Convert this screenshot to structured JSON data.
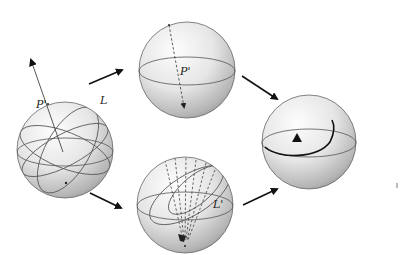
{
  "diagram": {
    "type": "flow",
    "colors": {
      "sphere_light": "#fbfbfb",
      "sphere_dark": "#9a9a9a",
      "line": "#555555",
      "arrow": "#111111",
      "background": "#ffffff"
    },
    "nodes": [
      {
        "id": "sphere-source",
        "labels": [
          "P'",
          "L"
        ],
        "cx": 65,
        "cy": 150,
        "r": 48
      },
      {
        "id": "sphere-top",
        "labels": [
          "P'"
        ],
        "cx": 187,
        "cy": 70,
        "r": 48
      },
      {
        "id": "sphere-bottom",
        "labels": [
          "L'"
        ],
        "cx": 185,
        "cy": 205,
        "r": 48
      },
      {
        "id": "sphere-result",
        "labels": [],
        "marker": "triangle",
        "cx": 309,
        "cy": 142,
        "r": 47
      }
    ],
    "edges": [
      {
        "from": "sphere-source",
        "to": "sphere-top"
      },
      {
        "from": "sphere-source",
        "to": "sphere-bottom"
      },
      {
        "from": "sphere-top",
        "to": "sphere-result"
      },
      {
        "from": "sphere-bottom",
        "to": "sphere-result"
      }
    ]
  },
  "labels": {
    "source_pole": "P'",
    "source_line": "L",
    "top_pole": "P'",
    "bottom_line": "L'"
  }
}
